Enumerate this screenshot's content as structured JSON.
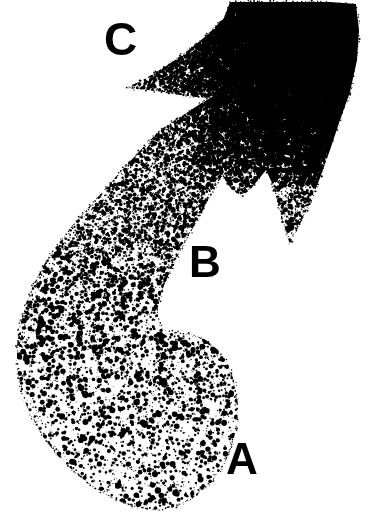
{
  "figure": {
    "background_color": "#ffffff",
    "ink_color": "#000000",
    "width": 369,
    "height": 525
  },
  "labels": [
    {
      "id": "A",
      "text": "A",
      "x": 226,
      "y": 437,
      "font_size": 44,
      "description": "sparse stipple zone, lower bulb"
    },
    {
      "id": "B",
      "text": "B",
      "x": 189,
      "y": 240,
      "font_size": 44,
      "description": "intermediate stipple zone, curving band"
    },
    {
      "id": "C",
      "text": "C",
      "x": 104,
      "y": 16,
      "font_size": 46,
      "description": "dense stipple zone, upper flared region"
    }
  ],
  "chart_data": {
    "type": "scatter",
    "xlabel": "",
    "ylabel": "",
    "xlim": [
      0,
      369
    ],
    "ylim": [
      0,
      525
    ],
    "grid": false,
    "legend_position": "none",
    "annotations": [
      {
        "label": "A",
        "x": 226,
        "y": 437
      },
      {
        "label": "B",
        "x": 189,
        "y": 240
      },
      {
        "label": "C",
        "x": 104,
        "y": 16
      }
    ],
    "series": [
      {
        "name": "A",
        "description": "Sparse large round dots, lower bulb of the comma",
        "relative_density": 0.16,
        "dot_radius_range": [
          0.5,
          3.4
        ],
        "mean_dots_per_1000px2": 4.2
      },
      {
        "name": "B",
        "description": "Intermediate density, curving ascending band",
        "relative_density": 0.45,
        "dot_radius_range": [
          0.5,
          3.0
        ],
        "mean_dots_per_1000px2": 13.5
      },
      {
        "name": "C",
        "description": "Very dense confluent stipple, upper flared notched region",
        "relative_density": 1.0,
        "dot_radius_range": [
          0.6,
          2.8
        ],
        "mean_dots_per_1000px2": 48.0
      }
    ],
    "outline_path": [
      [
        230,
        2
      ],
      [
        268,
        2
      ],
      [
        300,
        2
      ],
      [
        330,
        2
      ],
      [
        356,
        4
      ],
      [
        359,
        30
      ],
      [
        357,
        60
      ],
      [
        350,
        92
      ],
      [
        340,
        120
      ],
      [
        330,
        150
      ],
      [
        320,
        178
      ],
      [
        309,
        205
      ],
      [
        298,
        228
      ],
      [
        290,
        244
      ],
      [
        283,
        225
      ],
      [
        278,
        203
      ],
      [
        272,
        183
      ],
      [
        266,
        170
      ],
      [
        258,
        180
      ],
      [
        250,
        190
      ],
      [
        242,
        196
      ],
      [
        232,
        190
      ],
      [
        224,
        178
      ],
      [
        216,
        163
      ],
      [
        208,
        150
      ],
      [
        198,
        140
      ],
      [
        186,
        133
      ],
      [
        174,
        130
      ],
      [
        163,
        128
      ],
      [
        175,
        120
      ],
      [
        188,
        112
      ],
      [
        200,
        104
      ],
      [
        210,
        98
      ],
      [
        196,
        97
      ],
      [
        180,
        95
      ],
      [
        163,
        92
      ],
      [
        146,
        90
      ],
      [
        127,
        88
      ],
      [
        146,
        78
      ],
      [
        166,
        66
      ],
      [
        186,
        52
      ],
      [
        206,
        36
      ],
      [
        224,
        18
      ],
      [
        230,
        2
      ]
    ],
    "body_path": [
      [
        163,
        128
      ],
      [
        150,
        140
      ],
      [
        136,
        155
      ],
      [
        120,
        172
      ],
      [
        104,
        190
      ],
      [
        88,
        208
      ],
      [
        72,
        226
      ],
      [
        58,
        244
      ],
      [
        45,
        263
      ],
      [
        34,
        283
      ],
      [
        26,
        303
      ],
      [
        20,
        324
      ],
      [
        17,
        346
      ],
      [
        17,
        368
      ],
      [
        21,
        390
      ],
      [
        29,
        412
      ],
      [
        41,
        434
      ],
      [
        56,
        454
      ],
      [
        74,
        472
      ],
      [
        94,
        488
      ],
      [
        116,
        500
      ],
      [
        138,
        508
      ],
      [
        158,
        510
      ],
      [
        178,
        506
      ],
      [
        196,
        496
      ],
      [
        212,
        482
      ],
      [
        224,
        465
      ],
      [
        232,
        446
      ],
      [
        237,
        425
      ],
      [
        238,
        404
      ],
      [
        235,
        383
      ],
      [
        228,
        364
      ],
      [
        218,
        350
      ],
      [
        206,
        340
      ],
      [
        192,
        334
      ],
      [
        176,
        332
      ],
      [
        163,
        330
      ],
      [
        158,
        320
      ],
      [
        158,
        306
      ],
      [
        162,
        290
      ],
      [
        170,
        272
      ],
      [
        180,
        252
      ],
      [
        192,
        230
      ],
      [
        204,
        208
      ],
      [
        216,
        186
      ],
      [
        228,
        166
      ],
      [
        240,
        150
      ],
      [
        252,
        138
      ],
      [
        248,
        133
      ],
      [
        230,
        132
      ],
      [
        206,
        131
      ],
      [
        184,
        130
      ],
      [
        163,
        128
      ]
    ]
  }
}
